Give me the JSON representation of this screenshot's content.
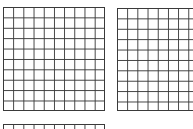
{
  "figure": {
    "type": "hundred-grids",
    "grids": [
      {
        "id": "grid-1",
        "rows": 10,
        "columns": 10,
        "shaded_cells": 0,
        "visible": "full"
      },
      {
        "id": "grid-2",
        "rows": 10,
        "columns": 10,
        "shaded_cells": 0,
        "visible": "clipped-right"
      },
      {
        "id": "grid-3",
        "rows": 10,
        "columns": 10,
        "shaded_cells": 0,
        "visible": "clipped-bottom"
      }
    ],
    "colors": {
      "line": "#3a3a3a",
      "background": "#ffffff"
    }
  }
}
